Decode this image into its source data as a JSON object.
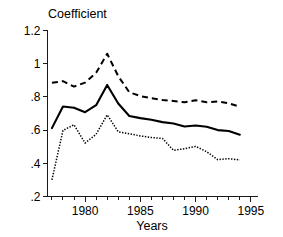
{
  "chart_data": {
    "type": "line",
    "title": "",
    "ylabel": "Coefficient",
    "xlabel": "Years",
    "grid": false,
    "legend": "none",
    "xlim": [
      1976.6,
      1995.6
    ],
    "ylim": [
      0.2,
      1.2
    ],
    "ytick_labels": [
      "1.2",
      "1",
      ".8",
      ".6",
      ".4",
      ".2"
    ],
    "ytick_values": [
      1.2,
      1.0,
      0.8,
      0.6,
      0.4,
      0.2
    ],
    "xtick_labels": [
      "1980",
      "1985",
      "1990",
      "1995"
    ],
    "xtick_values": [
      1980,
      1985,
      1990,
      1995
    ],
    "xtick_minor_values": [
      1977,
      1978,
      1979,
      1981,
      1982,
      1983,
      1984,
      1986,
      1987,
      1988,
      1989,
      1991,
      1992,
      1993,
      1994
    ],
    "x": [
      1977,
      1978,
      1979,
      1980,
      1981,
      1982,
      1983,
      1984,
      1985,
      1986,
      1987,
      1988,
      1989,
      1990,
      1991,
      1992,
      1993,
      1994
    ],
    "series": [
      {
        "name": "upper-bound",
        "style": "dashed",
        "color": "#000000",
        "values": [
          0.885,
          0.895,
          0.862,
          0.886,
          0.945,
          1.06,
          0.925,
          0.828,
          0.805,
          0.792,
          0.782,
          0.775,
          0.768,
          0.78,
          0.768,
          0.772,
          0.762,
          0.74
        ]
      },
      {
        "name": "point-estimate",
        "style": "solid",
        "color": "#000000",
        "values": [
          0.612,
          0.742,
          0.735,
          0.708,
          0.75,
          0.872,
          0.76,
          0.685,
          0.672,
          0.662,
          0.648,
          0.64,
          0.622,
          0.628,
          0.62,
          0.6,
          0.595,
          0.572
        ]
      },
      {
        "name": "lower-bound",
        "style": "dotted",
        "color": "#000000",
        "values": [
          0.3,
          0.598,
          0.632,
          0.522,
          0.575,
          0.692,
          0.59,
          0.578,
          0.565,
          0.555,
          0.55,
          0.478,
          0.488,
          0.502,
          0.47,
          0.422,
          0.428,
          0.42
        ]
      }
    ]
  }
}
